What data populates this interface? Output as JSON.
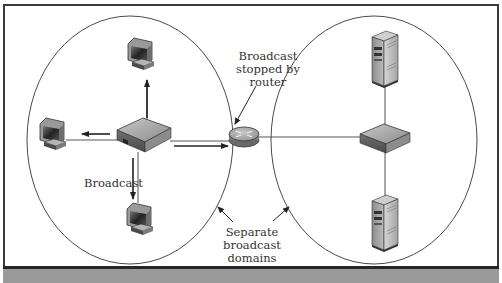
{
  "figure": {
    "type": "network-diagram",
    "labels": {
      "router_note": [
        "Broadcast",
        "stopped by",
        "router"
      ],
      "broadcast": "Broadcast",
      "domains_note": [
        "Separate",
        "broadcast",
        "domains"
      ]
    },
    "domains": [
      {
        "name": "left-broadcast-domain",
        "devices": [
          "switch",
          "computer-top",
          "computer-left",
          "computer-bottom"
        ]
      },
      {
        "name": "right-broadcast-domain",
        "devices": [
          "switch",
          "server-top",
          "server-bottom"
        ]
      }
    ],
    "center_device": "router",
    "colors": {
      "frame_border": "#3a3a3a",
      "bottom_bar": "#9a9a9a",
      "ellipse_stroke": "#4a4a4a",
      "line": "#555555",
      "arrow": "#222222"
    }
  }
}
